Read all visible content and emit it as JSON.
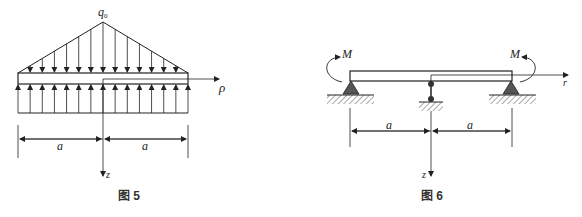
{
  "figure5": {
    "caption": "图 5",
    "load_label": "q",
    "load_subscript": "0",
    "axis_r_label": "ρ",
    "axis_z_label": "z",
    "dim_left": "a",
    "dim_right": "a"
  },
  "figure6": {
    "caption": "图 6",
    "moment_left": "M",
    "moment_right": "M",
    "axis_r_label": "r",
    "axis_z_label": "z",
    "dim_left": "a",
    "dim_right": "a"
  }
}
